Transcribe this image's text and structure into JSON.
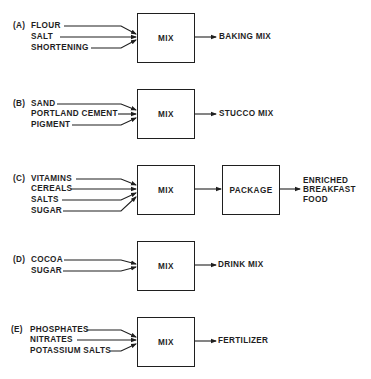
{
  "diagram": {
    "processes": [
      {
        "label": "(A)",
        "inputs": [
          "FLOUR",
          "SALT",
          "SHORTENING"
        ],
        "steps": [
          "MIX"
        ],
        "output": "BAKING MIX"
      },
      {
        "label": "(B)",
        "inputs": [
          "SAND",
          "PORTLAND CEMENT",
          "PIGMENT"
        ],
        "steps": [
          "MIX"
        ],
        "output": "STUCCO MIX"
      },
      {
        "label": "(C)",
        "inputs": [
          "VITAMINS",
          "CEREALS",
          "SALTS",
          "SUGAR"
        ],
        "steps": [
          "MIX",
          "PACKAGE"
        ],
        "output_lines": [
          "ENRICHED",
          "BREAKFAST",
          "FOOD"
        ]
      },
      {
        "label": "(D)",
        "inputs": [
          "COCOA",
          "SUGAR"
        ],
        "steps": [
          "MIX"
        ],
        "output": "DRINK MIX"
      },
      {
        "label": "(E)",
        "inputs": [
          "PHOSPHATES",
          "NITRATES",
          "POTASSIUM SALTS"
        ],
        "steps": [
          "MIX"
        ],
        "output": "FERTILIZER"
      }
    ]
  },
  "colors": {
    "ink": "#1f1f1f",
    "background": "#ffffff"
  }
}
